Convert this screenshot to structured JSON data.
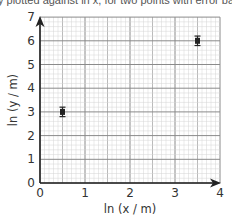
{
  "caption": "y plotted against ln x, for two points with error bars",
  "chart_data": {
    "type": "scatter",
    "title": "",
    "xlabel": "ln (x / m)",
    "ylabel": "ln (y / m)",
    "xlim": [
      0,
      4
    ],
    "ylim": [
      0,
      7
    ],
    "x_ticks": [
      "0",
      "1",
      "2",
      "3",
      "4"
    ],
    "y_ticks": [
      "0",
      "1",
      "2",
      "3",
      "4",
      "5",
      "6",
      "7"
    ],
    "grid": true,
    "series": [
      {
        "name": "data",
        "points": [
          {
            "x": 0.5,
            "y": 3.0,
            "y_err": 0.2
          },
          {
            "x": 3.5,
            "y": 6.0,
            "y_err": 0.2
          }
        ]
      }
    ],
    "legend": null
  },
  "colors": {
    "grid_minor": "#d4d4d4",
    "grid_major": "#8a8a8a",
    "axis": "#222222",
    "point": "#222222"
  }
}
